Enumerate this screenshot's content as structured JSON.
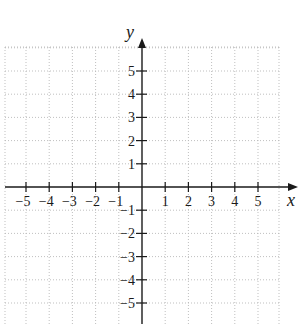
{
  "chart_data": {
    "type": "scatter",
    "title": "",
    "xlabel": "x",
    "ylabel": "y",
    "xlim": [
      -6,
      6
    ],
    "ylim": [
      -6,
      6
    ],
    "grid": true,
    "grid_style": "dotted",
    "x_ticks": [
      -5,
      -4,
      -3,
      -2,
      -1,
      1,
      2,
      3,
      4,
      5
    ],
    "y_ticks": [
      5,
      4,
      3,
      2,
      1,
      -1,
      -2,
      -3,
      -4,
      -5
    ],
    "x_tick_labels": [
      "−5",
      "−4",
      "−3",
      "−2",
      "−1",
      "1",
      "2",
      "3",
      "4",
      "5"
    ],
    "y_tick_labels": [
      "5",
      "4",
      "3",
      "2",
      "1",
      "−1",
      "−2",
      "−3",
      "−4",
      "−5"
    ],
    "series": [],
    "legend": null
  },
  "colors": {
    "axis": "#1a1a1a",
    "grid": "#b8b8b8",
    "background": "#ffffff"
  },
  "layout": {
    "origin_px": [
      142,
      187
    ],
    "unit_px": 23.2,
    "grid_left": 5,
    "grid_right": 279,
    "grid_top": 47,
    "grid_bottom": 324,
    "x_axis_start": 5,
    "x_axis_end": 298,
    "y_axis_top": 38,
    "y_axis_bottom": 324
  }
}
